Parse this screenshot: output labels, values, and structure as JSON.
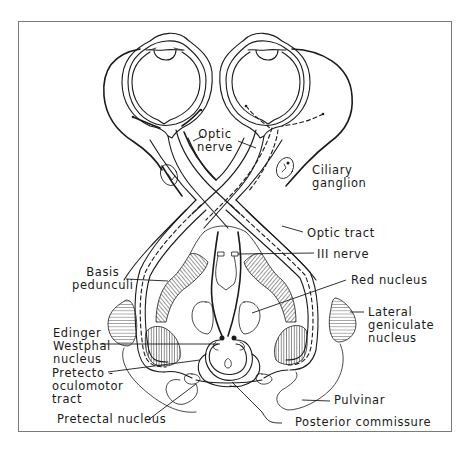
{
  "figure": {
    "labels": {
      "optic_nerve": "Optic\nnerve",
      "ciliary_ganglion": "Ciliary\nganglion",
      "optic_tract": "Optic tract",
      "iii_nerve": "III nerve",
      "basis_pedunculi": "Basis\npedunculi",
      "red_nucleus": "Red nucleus",
      "lateral_geniculate_nucleus": "Lateral\ngeniculate\nnucleus",
      "edinger_westphal_nucleus": "Edinger\nWestphal\nnucleus",
      "pretecto_oculomotor_tract": "Pretecto -\noculomotor\ntract",
      "pulvinar": "Pulvinar",
      "pretectal_nucleus": "Pretectal nucleus",
      "posterior_commissure": "Posterior commissure"
    },
    "colors": {
      "ink": "#1a1a1a",
      "frame": "#7a7a7a",
      "background": "#ffffff"
    }
  }
}
